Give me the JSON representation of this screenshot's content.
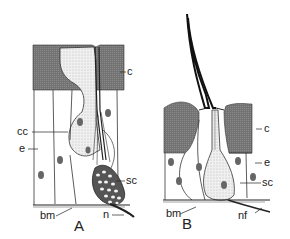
{
  "figure": {
    "panels": [
      {
        "id": "A",
        "label": "A",
        "labels": {
          "cuticle": "c",
          "conical_cell": "cc",
          "epithelium": "e",
          "sensory_cells": "sc",
          "basement_membrane": "bm",
          "nerve": "n"
        }
      },
      {
        "id": "B",
        "label": "B",
        "labels": {
          "cuticle": "c",
          "epithelium": "e",
          "sensory_cell": "sc",
          "basement_membrane": "bm",
          "nerve_fiber": "nf"
        }
      }
    ],
    "colors": {
      "cuticle": "#7a7a7a",
      "line": "#222222",
      "stipple": "#e6e6e6"
    }
  }
}
